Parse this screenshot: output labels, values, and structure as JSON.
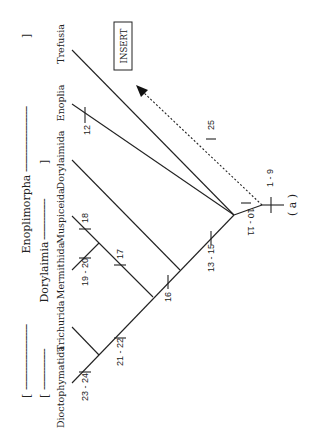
{
  "diagram": {
    "type": "cladogram",
    "orientation": "rotated-90-counterclockwise",
    "panel_label": "( a )",
    "group_brackets": [
      {
        "label": "Enoplimorpha",
        "open": "[",
        "close": "]",
        "dashes_left": "------------------------",
        "dashes_right": "------------------------"
      },
      {
        "label": "Dorylaimia",
        "open": "[",
        "close": "]",
        "dashes_left": "---------------",
        "dashes_right": "---------------"
      }
    ],
    "taxa": [
      "Dioctophymatida",
      "Trichurida",
      "Mermithida",
      "Muspiceida",
      "Dorylaimida",
      "Enoplia",
      "Trefusia"
    ],
    "insert_box": {
      "label": "INSERT"
    },
    "character_ticks": [
      {
        "label": "1 - 9"
      },
      {
        "label": "10 - 11"
      },
      {
        "label": "12"
      },
      {
        "label": "13 - 15"
      },
      {
        "label": "16"
      },
      {
        "label": "17"
      },
      {
        "label": "18"
      },
      {
        "label": "19 - 20"
      },
      {
        "label": "21 - 22"
      },
      {
        "label": "23 - 24"
      },
      {
        "label": "25"
      }
    ],
    "colors": {
      "line": "#222222",
      "background": "#ffffff"
    }
  }
}
